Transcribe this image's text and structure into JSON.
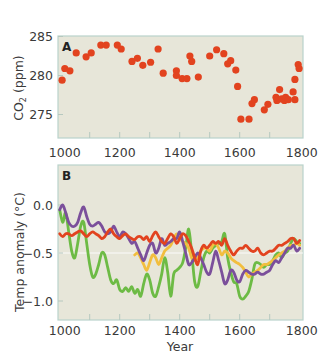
{
  "chart_data": [
    {
      "type": "scatter",
      "panel": "A",
      "title": "",
      "xlabel": "",
      "ylabel": "CO2 (ppm)",
      "xlim": [
        1000,
        1800
      ],
      "ylim": [
        272,
        285
      ],
      "xticks": [
        1000,
        1200,
        1400,
        1600,
        1800
      ],
      "xminorticks": [
        1100,
        1300,
        1500,
        1700
      ],
      "yticks": [
        275,
        280,
        285
      ],
      "grid": false,
      "marker_color": "#e2431f",
      "points": [
        {
          "x": 1008,
          "y": 279.4
        },
        {
          "x": 1017,
          "y": 280.9
        },
        {
          "x": 1034,
          "y": 280.6
        },
        {
          "x": 1055,
          "y": 282.9
        },
        {
          "x": 1088,
          "y": 282.4
        },
        {
          "x": 1105,
          "y": 282.9
        },
        {
          "x": 1137,
          "y": 283.9
        },
        {
          "x": 1155,
          "y": 283.9
        },
        {
          "x": 1192,
          "y": 283.9
        },
        {
          "x": 1205,
          "y": 283.4
        },
        {
          "x": 1241,
          "y": 281.8
        },
        {
          "x": 1259,
          "y": 282.2
        },
        {
          "x": 1277,
          "y": 281.3
        },
        {
          "x": 1303,
          "y": 281.7
        },
        {
          "x": 1328,
          "y": 283.4
        },
        {
          "x": 1345,
          "y": 280.3
        },
        {
          "x": 1389,
          "y": 280.6
        },
        {
          "x": 1389,
          "y": 280.0
        },
        {
          "x": 1408,
          "y": 279.6
        },
        {
          "x": 1424,
          "y": 279.6
        },
        {
          "x": 1462,
          "y": 279.8
        },
        {
          "x": 1434,
          "y": 282.5
        },
        {
          "x": 1440,
          "y": 281.8
        },
        {
          "x": 1500,
          "y": 282.5
        },
        {
          "x": 1523,
          "y": 283.3
        },
        {
          "x": 1547,
          "y": 282.8
        },
        {
          "x": 1560,
          "y": 281.5
        },
        {
          "x": 1570,
          "y": 281.9
        },
        {
          "x": 1587,
          "y": 280.7
        },
        {
          "x": 1593,
          "y": 278.6
        },
        {
          "x": 1604,
          "y": 274.4
        },
        {
          "x": 1631,
          "y": 274.4
        },
        {
          "x": 1641,
          "y": 276.4
        },
        {
          "x": 1649,
          "y": 276.9
        },
        {
          "x": 1682,
          "y": 275.6
        },
        {
          "x": 1694,
          "y": 276.3
        },
        {
          "x": 1721,
          "y": 277.2
        },
        {
          "x": 1733,
          "y": 278.2
        },
        {
          "x": 1724,
          "y": 276.8
        },
        {
          "x": 1740,
          "y": 277.0
        },
        {
          "x": 1749,
          "y": 276.8
        },
        {
          "x": 1753,
          "y": 277.2
        },
        {
          "x": 1762,
          "y": 276.9
        },
        {
          "x": 1778,
          "y": 277.9
        },
        {
          "x": 1784,
          "y": 279.5
        },
        {
          "x": 1784,
          "y": 276.9
        },
        {
          "x": 1795,
          "y": 281.4
        },
        {
          "x": 1798,
          "y": 280.9
        }
      ]
    },
    {
      "type": "line",
      "panel": "B",
      "title": "",
      "xlabel": "Year",
      "ylabel": "Temp anomaly (°C)",
      "xlim": [
        1000,
        1800
      ],
      "ylim": [
        -1.2,
        0.3
      ],
      "xticks": [
        1000,
        1200,
        1400,
        1600,
        1800
      ],
      "xminorticks": [
        1100,
        1300,
        1400,
        1500,
        1700
      ],
      "yticks": [
        0.0,
        -0.5,
        -1.0
      ],
      "reference_line": -0.5,
      "grid": false,
      "legend": "none",
      "series": [
        {
          "name": "green",
          "color": "#6dbb45",
          "x": [
            1000,
            1010,
            1020,
            1030,
            1040,
            1050,
            1060,
            1070,
            1080,
            1090,
            1100,
            1110,
            1120,
            1130,
            1140,
            1150,
            1160,
            1170,
            1180,
            1190,
            1200,
            1210,
            1220,
            1230,
            1240,
            1250,
            1260,
            1270,
            1280,
            1290,
            1300,
            1310,
            1320,
            1330,
            1340,
            1350,
            1360,
            1370,
            1380,
            1390,
            1400,
            1410,
            1420,
            1430,
            1440,
            1450,
            1460,
            1470,
            1480,
            1490,
            1500,
            1510,
            1520,
            1530,
            1540,
            1550,
            1560,
            1570,
            1580,
            1590,
            1600,
            1610,
            1620,
            1630,
            1640,
            1650,
            1660,
            1670,
            1680,
            1690,
            1700,
            1710,
            1720,
            1730,
            1740,
            1750,
            1760,
            1770,
            1780,
            1790,
            1800
          ],
          "y": [
            -0.05,
            -0.18,
            -0.08,
            -0.28,
            -0.48,
            -0.55,
            -0.4,
            -0.22,
            -0.18,
            -0.4,
            -0.62,
            -0.75,
            -0.72,
            -0.62,
            -0.5,
            -0.52,
            -0.65,
            -0.78,
            -0.82,
            -0.78,
            -0.88,
            -0.9,
            -0.86,
            -0.9,
            -0.85,
            -0.92,
            -0.88,
            -0.95,
            -0.82,
            -0.72,
            -0.78,
            -0.92,
            -0.95,
            -0.85,
            -0.72,
            -0.55,
            -0.7,
            -0.95,
            -0.72,
            -0.68,
            -0.65,
            -0.6,
            -0.45,
            -0.25,
            -0.5,
            -0.8,
            -0.85,
            -0.7,
            -0.55,
            -0.48,
            -0.5,
            -0.45,
            -0.42,
            -0.4,
            -0.38,
            -0.3,
            -0.55,
            -0.7,
            -0.8,
            -0.82,
            -0.95,
            -0.98,
            -0.95,
            -0.9,
            -0.78,
            -0.62,
            -0.6,
            -0.62,
            -0.65,
            -0.62,
            -0.62,
            -0.58,
            -0.52,
            -0.5,
            -0.55,
            -0.5,
            -0.48,
            -0.4,
            -0.35,
            -0.38,
            -0.4
          ]
        },
        {
          "name": "purple",
          "color": "#7b4f9b",
          "x": [
            1000,
            1010,
            1020,
            1030,
            1040,
            1050,
            1060,
            1070,
            1080,
            1090,
            1100,
            1110,
            1120,
            1130,
            1140,
            1150,
            1160,
            1170,
            1180,
            1190,
            1200,
            1210,
            1220,
            1230,
            1240,
            1250,
            1260,
            1270,
            1280,
            1290,
            1300,
            1310,
            1320,
            1330,
            1340,
            1350,
            1360,
            1370,
            1380,
            1390,
            1400,
            1410,
            1420,
            1430,
            1440,
            1450,
            1460,
            1470,
            1480,
            1490,
            1500,
            1510,
            1520,
            1530,
            1540,
            1550,
            1560,
            1570,
            1580,
            1590,
            1600,
            1610,
            1620,
            1630,
            1640,
            1650,
            1660,
            1670,
            1680,
            1690,
            1700,
            1710,
            1720,
            1730,
            1740,
            1750,
            1760,
            1770,
            1780,
            1790,
            1800
          ],
          "y": [
            -0.05,
            0.0,
            -0.08,
            -0.18,
            -0.22,
            -0.22,
            -0.18,
            -0.08,
            -0.02,
            -0.12,
            -0.2,
            -0.22,
            -0.2,
            -0.18,
            -0.22,
            -0.28,
            -0.3,
            -0.28,
            -0.22,
            -0.28,
            -0.33,
            -0.28,
            -0.3,
            -0.35,
            -0.4,
            -0.38,
            -0.45,
            -0.52,
            -0.58,
            -0.5,
            -0.42,
            -0.4,
            -0.5,
            -0.45,
            -0.35,
            -0.42,
            -0.4,
            -0.38,
            -0.35,
            -0.35,
            -0.28,
            -0.38,
            -0.5,
            -0.62,
            -0.6,
            -0.55,
            -0.5,
            -0.55,
            -0.62,
            -0.7,
            -0.72,
            -0.6,
            -0.48,
            -0.58,
            -0.7,
            -0.82,
            -0.78,
            -0.68,
            -0.7,
            -0.78,
            -0.8,
            -0.72,
            -0.68,
            -0.7,
            -0.72,
            -0.72,
            -0.7,
            -0.72,
            -0.72,
            -0.7,
            -0.68,
            -0.62,
            -0.58,
            -0.6,
            -0.55,
            -0.5,
            -0.45,
            -0.45,
            -0.42,
            -0.48,
            -0.45
          ]
        },
        {
          "name": "red",
          "color": "#e2431f",
          "x": [
            1000,
            1010,
            1020,
            1030,
            1040,
            1050,
            1060,
            1070,
            1080,
            1090,
            1100,
            1110,
            1120,
            1130,
            1140,
            1150,
            1160,
            1170,
            1180,
            1190,
            1200,
            1210,
            1220,
            1230,
            1240,
            1250,
            1260,
            1270,
            1280,
            1290,
            1300,
            1310,
            1320,
            1330,
            1340,
            1350,
            1360,
            1370,
            1380,
            1390,
            1400,
            1410,
            1420,
            1430,
            1440,
            1450,
            1460,
            1470,
            1480,
            1490,
            1500,
            1510,
            1520,
            1530,
            1540,
            1550,
            1560,
            1570,
            1580,
            1590,
            1600,
            1610,
            1620,
            1630,
            1640,
            1650,
            1660,
            1670,
            1680,
            1690,
            1700,
            1710,
            1720,
            1730,
            1740,
            1750,
            1760,
            1770,
            1780,
            1790,
            1800
          ],
          "y": [
            -0.3,
            -0.33,
            -0.3,
            -0.3,
            -0.32,
            -0.3,
            -0.28,
            -0.27,
            -0.3,
            -0.33,
            -0.3,
            -0.28,
            -0.3,
            -0.32,
            -0.35,
            -0.33,
            -0.28,
            -0.25,
            -0.3,
            -0.33,
            -0.35,
            -0.32,
            -0.3,
            -0.33,
            -0.35,
            -0.36,
            -0.33,
            -0.33,
            -0.36,
            -0.33,
            -0.38,
            -0.32,
            -0.28,
            -0.33,
            -0.38,
            -0.4,
            -0.35,
            -0.3,
            -0.33,
            -0.4,
            -0.35,
            -0.3,
            -0.32,
            -0.38,
            -0.45,
            -0.55,
            -0.62,
            -0.48,
            -0.42,
            -0.45,
            -0.42,
            -0.38,
            -0.4,
            -0.38,
            -0.42,
            -0.35,
            -0.42,
            -0.48,
            -0.52,
            -0.48,
            -0.45,
            -0.45,
            -0.42,
            -0.45,
            -0.48,
            -0.48,
            -0.45,
            -0.5,
            -0.52,
            -0.5,
            -0.48,
            -0.48,
            -0.45,
            -0.42,
            -0.42,
            -0.4,
            -0.38,
            -0.35,
            -0.35,
            -0.4,
            -0.37
          ]
        },
        {
          "name": "yellow",
          "color": "#f2be3e",
          "x": [
            1250,
            1260,
            1270,
            1280,
            1290,
            1300,
            1310,
            1320,
            1330,
            1340,
            1350,
            1360,
            1370,
            1380,
            1390,
            1400,
            1410,
            1420,
            1430,
            1440,
            1450,
            1460,
            1470,
            1480,
            1490,
            1500,
            1510,
            1520,
            1530,
            1540,
            1550,
            1560,
            1570,
            1580,
            1590,
            1600,
            1610,
            1620,
            1630,
            1640,
            1650,
            1660,
            1670,
            1680,
            1690,
            1700,
            1710,
            1720,
            1730,
            1740,
            1750,
            1760,
            1770,
            1780,
            1790,
            1800
          ],
          "y": [
            -0.52,
            -0.5,
            -0.55,
            -0.62,
            -0.68,
            -0.6,
            -0.52,
            -0.55,
            -0.62,
            -0.55,
            -0.48,
            -0.45,
            -0.42,
            -0.35,
            -0.3,
            -0.35,
            -0.38,
            -0.4,
            -0.45,
            -0.55,
            -0.58,
            -0.55,
            -0.48,
            -0.45,
            -0.45,
            -0.48,
            -0.42,
            -0.4,
            -0.45,
            -0.52,
            -0.48,
            -0.5,
            -0.55,
            -0.58,
            -0.6,
            -0.62,
            -0.65,
            -0.7,
            -0.75,
            -0.72,
            -0.7,
            -0.68,
            -0.65,
            -0.62,
            -0.62,
            -0.6,
            -0.58,
            -0.55,
            -0.52,
            -0.5,
            -0.48,
            -0.45,
            -0.42,
            -0.42,
            -0.4,
            -0.42
          ]
        }
      ]
    }
  ],
  "panels": {
    "a": {
      "letter": "A",
      "ylabel_main": "CO",
      "ylabel_sub": "2",
      "ylabel_unit": " (ppm)"
    },
    "b": {
      "letter": "B",
      "ylabel": "Temp anomaly (°C)",
      "xlabel": "Year"
    }
  },
  "colors": {
    "panel_bg": "#e7e6d9",
    "panel_border": "#b9d3cb",
    "co2": "#e2431f",
    "green": "#6dbb45",
    "purple": "#7b4f9b",
    "red": "#e2431f",
    "yellow": "#f2be3e"
  }
}
